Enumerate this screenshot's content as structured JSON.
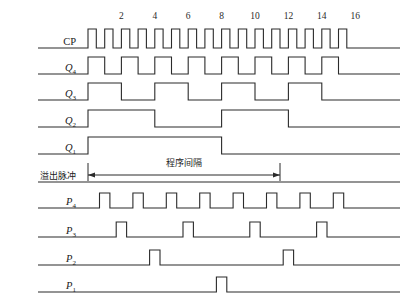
{
  "figure": {
    "kind": "digital-timing-diagram",
    "background_color": "#ffffff",
    "stroke_color": "#2b2b2b"
  },
  "axis": {
    "tick_labels": [
      "2",
      "4",
      "6",
      "8",
      "10",
      "12",
      "14",
      "16"
    ],
    "tick_counts": [
      2,
      4,
      6,
      8,
      10,
      12,
      14,
      16
    ],
    "origin_x": 88,
    "unit_px": 16.7,
    "total_counts": 16,
    "line_start_x": 38,
    "line_end_x": 400
  },
  "signals": [
    {
      "id": "CP",
      "label": "CP",
      "sub": "",
      "italic": false,
      "baseline_y": 48,
      "amplitude": 19,
      "kind": "clock",
      "divider": 1,
      "description": "clock pulse train, 16 pulses"
    },
    {
      "id": "Q4",
      "label": "Q",
      "sub": "4",
      "italic": true,
      "baseline_y": 74,
      "amplitude": 17,
      "kind": "divide",
      "divider": 2,
      "description": "divide by 2 of CP"
    },
    {
      "id": "Q3",
      "label": "Q",
      "sub": "3",
      "italic": true,
      "baseline_y": 100,
      "amplitude": 17,
      "kind": "divide",
      "divider": 4,
      "description": "divide by 4 of CP"
    },
    {
      "id": "Q2",
      "label": "Q",
      "sub": "2",
      "italic": true,
      "baseline_y": 127,
      "amplitude": 17,
      "kind": "divide",
      "divider": 8,
      "description": "divide by 8 of CP"
    },
    {
      "id": "Q1",
      "label": "Q",
      "sub": "1",
      "italic": true,
      "baseline_y": 154,
      "amplitude": 17,
      "kind": "divide",
      "divider": 16,
      "description": "divide by 16 of CP"
    },
    {
      "id": "OVF",
      "label": "溢出脉冲",
      "sub": "",
      "italic": false,
      "chinese": true,
      "baseline_y": 182,
      "amplitude": 0,
      "kind": "flat",
      "divider": 0,
      "description": "overflow pulse line, held low across window"
    },
    {
      "id": "P4",
      "label": "P",
      "sub": "4",
      "italic": true,
      "baseline_y": 208,
      "amplitude": 15,
      "kind": "pulses",
      "pulse_counts": [
        1,
        3,
        5,
        7,
        9,
        11,
        13,
        15
      ],
      "pulse_width_counts": 0.62,
      "description": "8 narrow pulses at odd counts"
    },
    {
      "id": "P3",
      "label": "P",
      "sub": "3",
      "italic": true,
      "baseline_y": 237,
      "amplitude": 15,
      "kind": "pulses",
      "pulse_counts": [
        2,
        6,
        10,
        14
      ],
      "pulse_width_counts": 0.62,
      "description": "4 narrow pulses"
    },
    {
      "id": "P2",
      "label": "P",
      "sub": "2",
      "italic": true,
      "baseline_y": 265,
      "amplitude": 15,
      "kind": "pulses",
      "pulse_counts": [
        4,
        12
      ],
      "pulse_width_counts": 0.62,
      "description": "2 narrow pulses"
    },
    {
      "id": "P1",
      "label": "P",
      "sub": "1",
      "italic": true,
      "baseline_y": 292,
      "amplitude": 15,
      "kind": "pulses",
      "pulse_counts": [
        8
      ],
      "pulse_width_counts": 0.62,
      "description": "1 narrow pulse"
    }
  ],
  "annotation": {
    "text": "程序间隔",
    "text_x": 184,
    "text_y": 166,
    "arrow_y": 175,
    "arrow_start_x": 88,
    "arrow_end_x": 280,
    "tick_top_y": 163,
    "tick_bottom_y": 181
  }
}
